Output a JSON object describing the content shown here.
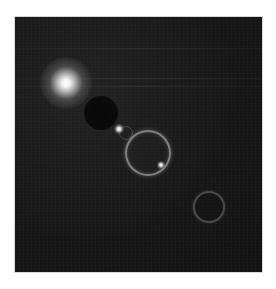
{
  "image": {
    "subject": "lens flare",
    "background_color": "#141414",
    "border_color": "#ffffff"
  },
  "elements": {
    "light_source": {
      "label": "bright light source"
    },
    "dark_disc": {
      "label": "dark flare disc"
    },
    "small_dot": {
      "label": "small bright flare dot"
    },
    "large_ring": {
      "label": "large flare ring"
    },
    "ring_dot": {
      "label": "bright spot on ring"
    },
    "bottom_ring": {
      "label": "dim flare ring"
    }
  }
}
